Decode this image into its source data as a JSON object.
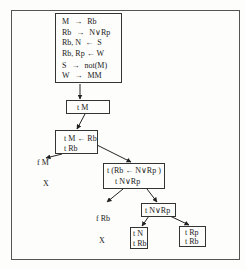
{
  "diagram": {
    "type": "proof-tree",
    "rules_box": {
      "rules": [
        {
          "lhs": "M",
          "arrow": "→",
          "rhs": "Rb"
        },
        {
          "lhs": "Rb",
          "arrow": "→",
          "rhs": "N∨Rp"
        },
        {
          "lhs": "Rb, N",
          "arrow": "←",
          "rhs": "S"
        },
        {
          "lhs": "Rb, Rp",
          "arrow": "←",
          "rhs": "W"
        },
        {
          "lhs": "S",
          "arrow": "→",
          "rhs": "not(M)"
        },
        {
          "lhs": "W",
          "arrow": "→",
          "rhs": "MM"
        }
      ]
    },
    "nodes": {
      "n1": {
        "lines": [
          "t M"
        ]
      },
      "n2": {
        "lines": [
          "t M ← Rb",
          "t Rb"
        ]
      },
      "n3": {
        "lines": [
          "t (Rb ← N∨Rp )",
          "t N∨Rp"
        ]
      },
      "n4": {
        "lines": [
          "t N∨Rp"
        ]
      },
      "n5": {
        "lines": [
          "t N",
          "t Rb"
        ]
      },
      "n6": {
        "lines": [
          "t Rp",
          "t Rb"
        ]
      }
    },
    "leaves": {
      "fM": {
        "label": "f M",
        "closed": "X"
      },
      "fRb": {
        "label": "f Rb",
        "closed": "X"
      }
    },
    "edges": [
      {
        "from": "rules_box",
        "to": "n1"
      },
      {
        "from": "n1",
        "to": "n2"
      },
      {
        "from": "n2",
        "to": "fM"
      },
      {
        "from": "n2",
        "to": "n3"
      },
      {
        "from": "n3",
        "to": "fRb"
      },
      {
        "from": "n3",
        "to": "n4"
      },
      {
        "from": "n4",
        "to": "n5"
      },
      {
        "from": "n4",
        "to": "n6"
      }
    ]
  }
}
